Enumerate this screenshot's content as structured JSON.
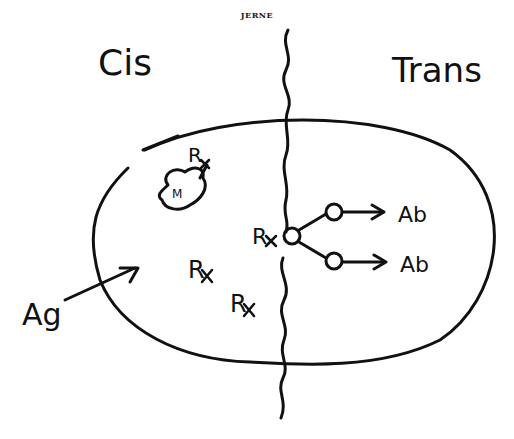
{
  "header": {
    "title": "JERNE"
  },
  "labels": {
    "cis": "Cis",
    "trans": "Trans",
    "antigen": "Ag",
    "antibody_1": "Ab",
    "antibody_2": "Ab",
    "receptor_center": "R",
    "receptor_1": "R",
    "receptor_2": "R",
    "receptor_top": "R",
    "membrane_blob": "M"
  },
  "colors": {
    "ink": "#111111",
    "background": "#ffffff"
  }
}
